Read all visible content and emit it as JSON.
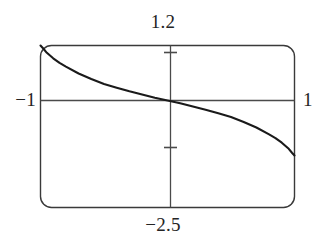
{
  "chart_data": {
    "type": "line",
    "title": "",
    "subtitle": "",
    "xlabel": "",
    "ylabel": "",
    "xlim": [
      -1,
      1
    ],
    "ylim": [
      -2.5,
      1.2
    ],
    "grid": false,
    "legend": null,
    "frame": "rounded-rectangle",
    "axes_cross_at": [
      0,
      0
    ],
    "tick_labels": {
      "top": "1.2",
      "bottom": "−2.5",
      "left": "−1",
      "right": "1"
    },
    "y_axis_ticks": [
      1,
      -1
    ],
    "x_axis_ticks": [],
    "line_color": "#1a1a1a",
    "axis_color": "#4a4a4a",
    "frame_color": "#3a3a3a",
    "background_color": "#ffffff",
    "series": [
      {
        "name": "curve",
        "description": "decreasing arcsine-like curve, odd-symmetric about origin",
        "x": [
          -1.0,
          -0.98,
          -0.95,
          -0.9,
          -0.85,
          -0.8,
          -0.7,
          -0.6,
          -0.5,
          -0.4,
          -0.3,
          -0.2,
          -0.1,
          0.0,
          0.1,
          0.2,
          0.3,
          0.4,
          0.5,
          0.6,
          0.7,
          0.8,
          0.85,
          0.9,
          0.95,
          0.98,
          1.0
        ],
        "y": [
          1.2,
          1.14,
          1.04,
          0.92,
          0.82,
          0.74,
          0.59,
          0.47,
          0.36,
          0.28,
          0.2,
          0.13,
          0.06,
          0.0,
          -0.06,
          -0.13,
          -0.2,
          -0.28,
          -0.36,
          -0.47,
          -0.59,
          -0.74,
          -0.82,
          -0.92,
          -1.04,
          -1.14,
          -1.2
        ]
      }
    ],
    "points_count": 27
  },
  "labels": {
    "top": "1.2",
    "bottom": "−2.5",
    "left": "−1",
    "right": "1"
  }
}
